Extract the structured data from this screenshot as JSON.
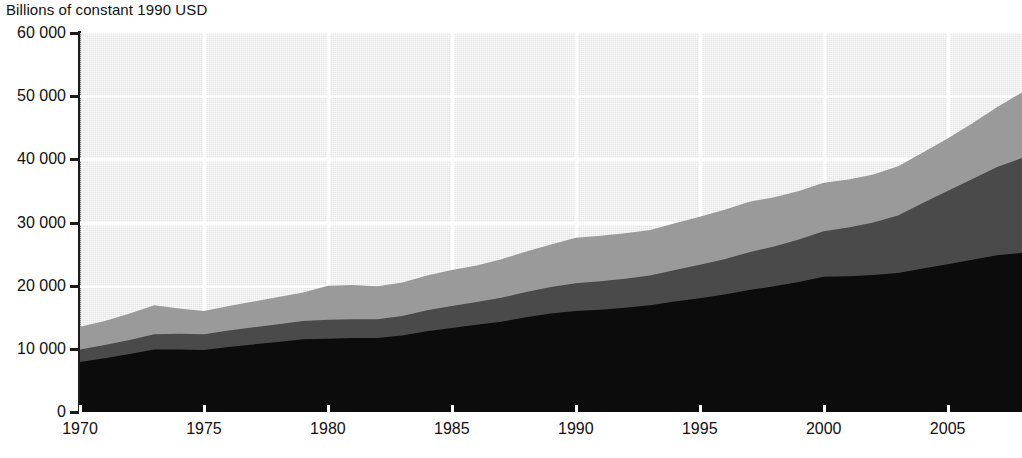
{
  "chart_data": {
    "type": "area",
    "title": "Billions of constant 1990 USD",
    "subtitle": "",
    "xlabel": "",
    "ylabel": "Billions of constant 1990 USD",
    "stacked": true,
    "grid": true,
    "legend_position": "none",
    "xlim": [
      1970,
      2008
    ],
    "ylim": [
      0,
      60000
    ],
    "ytick_labels": [
      "60 000",
      "50 000",
      "40 000",
      "30 000",
      "20 000",
      "10 000",
      "0"
    ],
    "ytick_values": [
      60000,
      50000,
      40000,
      30000,
      20000,
      10000,
      0
    ],
    "xtick_labels": [
      "1970",
      "1975",
      "1980",
      "1985",
      "1990",
      "1995",
      "2000",
      "2005"
    ],
    "xtick_values": [
      1970,
      1975,
      1980,
      1985,
      1990,
      1995,
      2000,
      2005
    ],
    "x": [
      1970,
      1971,
      1972,
      1973,
      1974,
      1975,
      1976,
      1977,
      1978,
      1979,
      1980,
      1981,
      1982,
      1983,
      1984,
      1985,
      1986,
      1987,
      1988,
      1989,
      1990,
      1991,
      1992,
      1993,
      1994,
      1995,
      1996,
      1997,
      1998,
      1999,
      2000,
      2001,
      2002,
      2003,
      2004,
      2005,
      2006,
      2007,
      2008
    ],
    "series": [
      {
        "name": "series-bottom",
        "color": "#0c0c0c",
        "values": [
          7900,
          8500,
          9200,
          9900,
          9900,
          9800,
          10300,
          10700,
          11100,
          11500,
          11600,
          11700,
          11700,
          12100,
          12800,
          13300,
          13800,
          14300,
          15000,
          15600,
          16000,
          16200,
          16500,
          16900,
          17500,
          18000,
          18600,
          19300,
          19900,
          20600,
          21400,
          21500,
          21700,
          22000,
          22700,
          23400,
          24100,
          24800,
          25200
        ]
      },
      {
        "name": "series-middle",
        "color": "#4a4a4a",
        "values": [
          2000,
          2100,
          2200,
          2400,
          2500,
          2500,
          2600,
          2700,
          2800,
          2900,
          3000,
          3000,
          3000,
          3100,
          3300,
          3500,
          3600,
          3800,
          4000,
          4200,
          4400,
          4500,
          4600,
          4700,
          5000,
          5300,
          5600,
          6000,
          6300,
          6700,
          7200,
          7700,
          8300,
          9100,
          10400,
          11600,
          12800,
          14000,
          15000
        ]
      },
      {
        "name": "series-top",
        "color": "#9a9a9a",
        "values": [
          3600,
          3800,
          4200,
          4600,
          4000,
          3700,
          3900,
          4100,
          4300,
          4500,
          5400,
          5400,
          5200,
          5300,
          5500,
          5700,
          5800,
          6100,
          6400,
          6700,
          7200,
          7200,
          7200,
          7200,
          7400,
          7600,
          7800,
          8000,
          7800,
          7700,
          7700,
          7600,
          7600,
          7800,
          8000,
          8300,
          8800,
          9500,
          10400
        ]
      }
    ],
    "cumulative_top_totals": [
      13500,
      14400,
      15600,
      16900,
      16400,
      16000,
      16800,
      17500,
      18200,
      18900,
      20000,
      20100,
      19900,
      20500,
      21600,
      22500,
      23200,
      24200,
      25400,
      26500,
      27600,
      27900,
      28300,
      28800,
      29900,
      30900,
      32000,
      33300,
      34000,
      35000,
      36300,
      36800,
      37600,
      38900,
      41100,
      43300,
      45700,
      48300,
      50600
    ],
    "colors": {
      "plot_background": "#e6e6e6",
      "gridline": "#ffffff",
      "axis": "#1b1b1b",
      "band_bottom": "#0c0c0c",
      "band_middle": "#4a4a4a",
      "band_top": "#9a9a9a"
    }
  }
}
